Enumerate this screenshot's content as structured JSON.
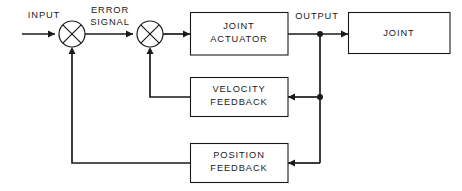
{
  "diagram": {
    "type": "control-system-block-diagram",
    "background_color": "#ffffff",
    "line_color": "#1a1a1a",
    "blocks": [
      {
        "id": "joint-actuator",
        "line1": "JOINT",
        "line2": "ACTUATOR"
      },
      {
        "id": "joint",
        "line1": "JOINT",
        "line2": ""
      },
      {
        "id": "velocity-feedback",
        "line1": "VELOCITY",
        "line2": "FEEDBACK"
      },
      {
        "id": "position-feedback",
        "line1": "POSITION",
        "line2": "FEEDBACK"
      }
    ],
    "signal_labels": [
      {
        "id": "input",
        "text": "INPUT"
      },
      {
        "id": "error-signal",
        "line1": "ERROR",
        "line2": "SIGNAL"
      },
      {
        "id": "output",
        "text": "OUTPUT"
      }
    ],
    "summing_junctions": [
      {
        "id": "summing-junction-1",
        "cx": 72,
        "cy": 34,
        "r": 13
      },
      {
        "id": "summing-junction-2",
        "cx": 150,
        "cy": 34,
        "r": 13
      }
    ],
    "junction_dots": [
      {
        "id": "output-tap",
        "cx": 320,
        "cy": 34
      },
      {
        "id": "velocity-tap",
        "cx": 320,
        "cy": 97
      }
    ],
    "connections": [
      "INPUT to summing junction 1",
      "summing junction 1 to summing junction 2 (ERROR SIGNAL)",
      "summing junction 2 to JOINT ACTUATOR",
      "JOINT ACTUATOR to JOINT (OUTPUT)",
      "OUTPUT tap to VELOCITY FEEDBACK",
      "VELOCITY FEEDBACK to summing junction 2",
      "OUTPUT tap to POSITION FEEDBACK",
      "POSITION FEEDBACK to summing junction 1"
    ]
  }
}
